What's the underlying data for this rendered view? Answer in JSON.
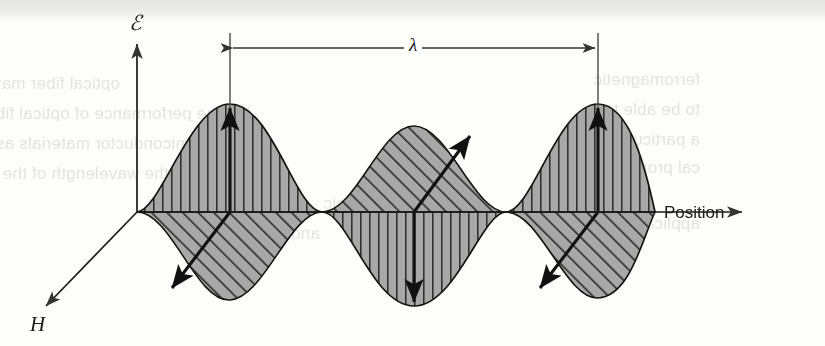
{
  "figure": {
    "background_color": "#fdfdfc",
    "ink_color": "#1b1b1b",
    "fill_gray": "#a8a8a8",
    "hatch_color": "#2a2a2a"
  },
  "axes": {
    "vertical": {
      "label": "ℰ",
      "name": "electric-field-axis",
      "description": "electric field amplitude, points up",
      "x": 137,
      "top_y": 40,
      "bottom_y": 212
    },
    "horizontal": {
      "label": "Position",
      "name": "position-axis",
      "description": "propagation direction, points right",
      "y": 212,
      "left_x": 137,
      "right_x": 745
    },
    "depth": {
      "label": "H",
      "name": "magnetic-field-axis",
      "description": "magnetic field axis, points down-left out of page",
      "from_x": 137,
      "from_y": 212,
      "to_x": 42,
      "to_y": 310
    }
  },
  "wavelength_marker": {
    "symbol": "λ",
    "name": "wavelength",
    "left_tick_x": 230,
    "right_tick_x": 598,
    "line_y": 48,
    "tick_top_y": 33,
    "tick_bottom_y": 108,
    "span_px": 368,
    "measured_between": "first E-field crest and third E-field crest"
  },
  "chart_data": {
    "type": "line",
    "xlabel": "Position",
    "ylabel": "ℰ",
    "grid": false,
    "legend": "none",
    "x_range_px": [
      137,
      655
    ],
    "baseline_y_px": 212,
    "wavelength_px": 368,
    "series": [
      {
        "name": "E-field",
        "symbol": "ℰ",
        "hatch": "vertical",
        "arrow_direction": "vertical",
        "amplitude_px": 108,
        "phase": "sine starting at zero rising",
        "lobes": [
          {
            "index": 1,
            "sign": "positive",
            "center_x": 230,
            "peak_y": 104,
            "arrow": "up"
          },
          {
            "index": 2,
            "sign": "negative",
            "center_x": 414,
            "peak_y": 302,
            "arrow": "down"
          },
          {
            "index": 3,
            "sign": "positive",
            "center_x": 598,
            "peak_y": 104,
            "arrow": "up"
          }
        ]
      },
      {
        "name": "H-field",
        "symbol": "H",
        "hatch": "diagonal-45",
        "arrow_direction": "diagonal",
        "amplitude_px": 90,
        "phase": "inverted relative to E-field",
        "lobes": [
          {
            "index": 1,
            "sign": "negative",
            "center_x": 230,
            "peak_y": 296,
            "arrow": "down-left"
          },
          {
            "index": 2,
            "sign": "positive",
            "center_x": 414,
            "peak_y": 128,
            "arrow": "up-right"
          },
          {
            "index": 3,
            "sign": "negative",
            "center_x": 598,
            "peak_y": 296,
            "arrow": "down-left"
          }
        ]
      }
    ],
    "zero_crossings_px": [
      137,
      322,
      506,
      655
    ]
  },
  "page_bleed": {
    "description": "faint mirrored show-through text from the reverse side of the scanned page",
    "lines": [
      {
        "text": "optical fiber materials in communications",
        "x": 120,
        "y": 74,
        "size": 17
      },
      {
        "text": "but the performance of optical fibers",
        "x": 250,
        "y": 104,
        "size": 17
      },
      {
        "text": "semiconductor materials as well as reflex",
        "x": 208,
        "y": 134,
        "size": 17
      },
      {
        "text": "material at the wavelength of the",
        "x": 255,
        "y": 164,
        "size": 17
      },
      {
        "text": "spectroscopic",
        "x": 430,
        "y": 194,
        "size": 17
      },
      {
        "text": "and concentration",
        "x": 320,
        "y": 224,
        "size": 17
      },
      {
        "text": "ferromagnetic",
        "x": 700,
        "y": 70,
        "size": 17
      },
      {
        "text": "to be able to",
        "x": 700,
        "y": 100,
        "size": 17
      },
      {
        "text": "a particular",
        "x": 700,
        "y": 130,
        "size": 17
      },
      {
        "text": "cal properties",
        "x": 700,
        "y": 158,
        "size": 17
      },
      {
        "text": "applications on",
        "x": 700,
        "y": 214,
        "size": 17
      }
    ]
  }
}
